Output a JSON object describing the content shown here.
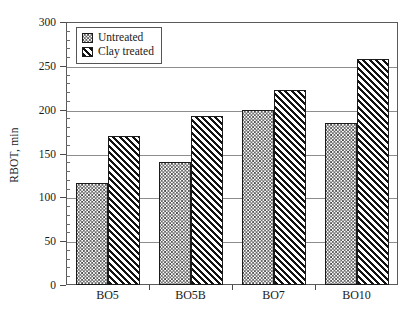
{
  "chart_data": {
    "type": "bar",
    "title": "",
    "xlabel": "",
    "ylabel": "RBOT, min",
    "ylim": [
      0,
      300
    ],
    "ytick_step": 50,
    "yticks": [
      0,
      50,
      100,
      150,
      200,
      250,
      300
    ],
    "ytick_labels": [
      "0",
      "50",
      "100",
      "150",
      "200",
      "250",
      "300"
    ],
    "yminor_step": 10,
    "grid": "horizontal",
    "legend_position": "top-left",
    "categories": [
      "BO5",
      "BO5B",
      "BO7",
      "BO10"
    ],
    "series": [
      {
        "name": "Untreated",
        "fill": "fine-crosshatch",
        "values": [
          116,
          140,
          200,
          185
        ]
      },
      {
        "name": "Clay treated",
        "fill": "diagonal-hatch",
        "values": [
          170,
          193,
          222,
          258
        ]
      }
    ]
  },
  "legend": {
    "items": [
      {
        "label": "Untreated"
      },
      {
        "label": "Clay treated"
      }
    ]
  },
  "colors": {
    "frame": "#5a5a5a",
    "gridline": "#8d8d8d",
    "bar_outline": "#1b1b1b",
    "text": "#1a1a1a",
    "background": "#ffffff"
  }
}
